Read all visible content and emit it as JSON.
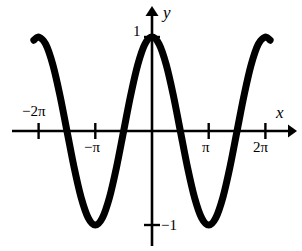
{
  "figure": {
    "width": 302,
    "height": 251,
    "background_color": "#ffffff",
    "ink_color": "#000000"
  },
  "axes": {
    "x_axis_label": "x",
    "y_axis_label": "y",
    "origin_px": {
      "x": 152,
      "y": 131
    },
    "pixels_per_pi": 56.7,
    "pixels_per_y_unit": 94,
    "x_tick_labels": [
      "−2π",
      "−π",
      "π",
      "2π"
    ],
    "y_tick_labels": [
      "1",
      "−1"
    ],
    "x_tick_neg2pi": "−2π",
    "x_tick_negpi": "−π",
    "x_tick_pi": "π",
    "x_tick_2pi": "2π",
    "y_tick_one": "1",
    "y_tick_negone": "−1"
  },
  "chart_data": {
    "type": "line",
    "title": "",
    "xlabel": "x",
    "ylabel": "y",
    "function": "y = cos(x)",
    "xlim": [
      -7.4,
      7.4
    ],
    "ylim": [
      -1.3,
      1.3
    ],
    "grid": false,
    "legend": null,
    "xticks": [
      -6.283185,
      -3.141593,
      3.141593,
      6.283185
    ],
    "xticklabels": [
      "−2π",
      "−π",
      "π",
      "2π"
    ],
    "yticks": [
      1,
      -1
    ],
    "yticklabels": [
      "1",
      "−1"
    ],
    "line_color": "#000000",
    "line_width": 7,
    "series": [
      {
        "name": "y = cos(x)",
        "x": [
          -6.545,
          -6.283,
          -5.89,
          -5.498,
          -5.105,
          -4.712,
          -4.32,
          -3.927,
          -3.534,
          -3.142,
          -2.749,
          -2.356,
          -1.963,
          -1.571,
          -1.178,
          -0.785,
          -0.393,
          0.0,
          0.393,
          0.785,
          1.178,
          1.571,
          1.963,
          2.356,
          2.749,
          3.142,
          3.534,
          3.927,
          4.32,
          4.712,
          5.105,
          5.498,
          5.89,
          6.283,
          6.545
        ],
        "y": [
          0.966,
          1.0,
          0.924,
          0.707,
          0.383,
          0.0,
          -0.383,
          -0.707,
          -0.924,
          -1.0,
          -0.924,
          -0.707,
          -0.383,
          0.0,
          0.383,
          0.707,
          0.924,
          1.0,
          0.924,
          0.707,
          0.383,
          0.0,
          -0.383,
          -0.707,
          -0.924,
          -1.0,
          -0.924,
          -0.707,
          -0.383,
          0.0,
          0.383,
          0.707,
          0.924,
          1.0,
          0.966
        ]
      }
    ],
    "maxima_x": [
      -6.283185,
      0,
      6.283185
    ],
    "maxima_y": [
      1,
      1,
      1
    ],
    "minima_x": [
      -3.141593,
      3.141593
    ],
    "minima_y": [
      -1,
      -1
    ],
    "zeros_x": [
      -4.712389,
      -1.570796,
      1.570796,
      4.712389
    ]
  }
}
